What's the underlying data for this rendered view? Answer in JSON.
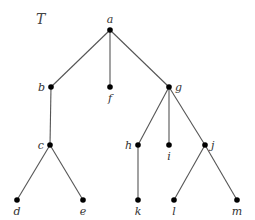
{
  "diagram": {
    "title": "T",
    "type": "rooted tree",
    "nodes": [
      {
        "id": "a",
        "label": "a",
        "x": 110,
        "y": 30,
        "lx": 110,
        "ly": 23,
        "anchor": "middle"
      },
      {
        "id": "b",
        "label": "b",
        "x": 51,
        "y": 87,
        "lx": 45,
        "ly": 91,
        "anchor": "end"
      },
      {
        "id": "f",
        "label": "f",
        "x": 110,
        "y": 87,
        "lx": 110,
        "ly": 102,
        "anchor": "middle"
      },
      {
        "id": "g",
        "label": "g",
        "x": 169,
        "y": 87,
        "lx": 175,
        "ly": 91,
        "anchor": "start"
      },
      {
        "id": "c",
        "label": "c",
        "x": 50,
        "y": 145,
        "lx": 44,
        "ly": 149,
        "anchor": "end"
      },
      {
        "id": "h",
        "label": "h",
        "x": 138,
        "y": 145,
        "lx": 132,
        "ly": 149,
        "anchor": "end"
      },
      {
        "id": "i",
        "label": "i",
        "x": 169,
        "y": 145,
        "lx": 169,
        "ly": 160,
        "anchor": "middle"
      },
      {
        "id": "j",
        "label": "j",
        "x": 205,
        "y": 145,
        "lx": 211,
        "ly": 149,
        "anchor": "start"
      },
      {
        "id": "d",
        "label": "d",
        "x": 17,
        "y": 200,
        "lx": 17,
        "ly": 215,
        "anchor": "middle"
      },
      {
        "id": "e",
        "label": "e",
        "x": 83,
        "y": 200,
        "lx": 83,
        "ly": 215,
        "anchor": "middle"
      },
      {
        "id": "k",
        "label": "k",
        "x": 138,
        "y": 200,
        "lx": 138,
        "ly": 215,
        "anchor": "middle"
      },
      {
        "id": "l",
        "label": "l",
        "x": 174,
        "y": 200,
        "lx": 174,
        "ly": 215,
        "anchor": "middle"
      },
      {
        "id": "m",
        "label": "m",
        "x": 237,
        "y": 200,
        "lx": 237,
        "ly": 215,
        "anchor": "middle"
      }
    ],
    "edges": [
      [
        "a",
        "b"
      ],
      [
        "a",
        "f"
      ],
      [
        "a",
        "g"
      ],
      [
        "b",
        "c"
      ],
      [
        "c",
        "d"
      ],
      [
        "c",
        "e"
      ],
      [
        "g",
        "h"
      ],
      [
        "g",
        "i"
      ],
      [
        "g",
        "j"
      ],
      [
        "h",
        "k"
      ],
      [
        "j",
        "l"
      ],
      [
        "j",
        "m"
      ]
    ],
    "colors": {
      "node": "#000000",
      "edge": "#555555",
      "label": "#333333"
    }
  }
}
